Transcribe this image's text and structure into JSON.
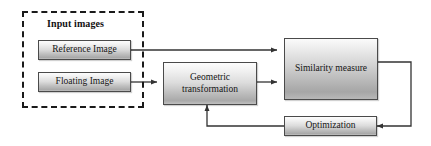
{
  "diagram": {
    "background_color": "#ffffff",
    "line_color": "#333333",
    "group": {
      "label": "Input images",
      "border_style": "dashed",
      "border_color": "#1a1a1a"
    },
    "nodes": [
      {
        "id": "reference",
        "label": "Reference Image"
      },
      {
        "id": "floating",
        "label": "Floating Image"
      },
      {
        "id": "geometric",
        "label": "Geometric transformation"
      },
      {
        "id": "similarity",
        "label": "Similarity measure"
      },
      {
        "id": "optimization",
        "label": "Optimization"
      }
    ],
    "edges": [
      {
        "id": "reference-to-similarity",
        "from": "reference",
        "to": "similarity"
      },
      {
        "id": "floating-to-geometric",
        "from": "floating",
        "to": "geometric"
      },
      {
        "id": "geometric-to-similarity",
        "from": "geometric",
        "to": "similarity"
      },
      {
        "id": "similarity-to-optimization",
        "from": "similarity",
        "to": "optimization"
      },
      {
        "id": "optimization-to-geometric",
        "from": "optimization",
        "to": "geometric"
      }
    ]
  }
}
